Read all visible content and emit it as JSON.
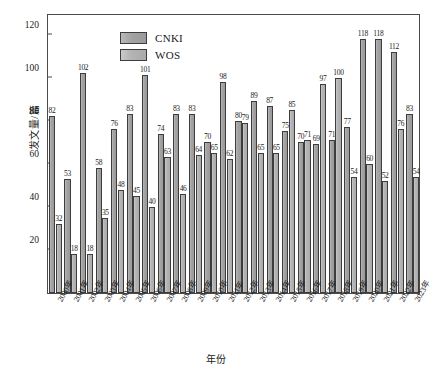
{
  "chart_data": {
    "type": "bar",
    "title": "",
    "xlabel": "年份",
    "ylabel": "发文量/篇",
    "ylim": [
      0,
      130
    ],
    "yticks": [
      20,
      40,
      60,
      80,
      100,
      120
    ],
    "grid": false,
    "legend_position": "top-left",
    "categories": [
      "2000年",
      "2001年",
      "2002年",
      "2003年",
      "2004年",
      "2005年",
      "2006年",
      "2007年",
      "2008年",
      "2009年",
      "2010年",
      "2011年",
      "2012年",
      "2013年",
      "2014年",
      "2015年",
      "2016年",
      "2017年",
      "2018年",
      "2019年",
      "2020年",
      "2021年",
      "2022年",
      "2023年"
    ],
    "series": [
      {
        "name": "CNKI",
        "color": "#a3a3a3",
        "values": [
          82,
          53,
          102,
          58,
          76,
          83,
          101,
          74,
          83,
          83,
          98,
          89,
          87,
          85,
          97,
          100,
          118,
          118,
          112,
          83,
          0,
          0,
          0,
          0
        ]
      },
      {
        "name": "WOS",
        "color": "#b4b4b4",
        "values": [
          32,
          18,
          18,
          35,
          48,
          45,
          40,
          63,
          46,
          64,
          70,
          65,
          62,
          80,
          79,
          65,
          65,
          75,
          70,
          71,
          69,
          71,
          77,
          54
        ]
      }
    ],
    "bars": [
      {
        "category": "2000年",
        "cnki": 82,
        "wos": 32
      },
      {
        "category": "2001年",
        "cnki": 53,
        "wos": 18
      },
      {
        "category": "2002年",
        "cnki": 102,
        "wos": 18
      },
      {
        "category": "2003年",
        "cnki": 58,
        "wos": 35
      },
      {
        "category": "2004年",
        "cnki": 76,
        "wos": 48
      },
      {
        "category": "2005年",
        "cnki": 83,
        "wos": 45
      },
      {
        "category": "2006年",
        "cnki": 101,
        "wos": 40
      },
      {
        "category": "2007年",
        "cnki": 74,
        "wos": 63
      },
      {
        "category": "2008年",
        "cnki": 83,
        "wos": 46
      },
      {
        "category": "2009年",
        "cnki": 83,
        "wos": 64
      },
      {
        "category": "2010年",
        "cnki": 70,
        "wos": 65
      },
      {
        "category": "2011年",
        "cnki": 98,
        "wos": 62
      },
      {
        "category": "2012年",
        "cnki": 80,
        "wos": 79
      },
      {
        "category": "2013年",
        "cnki": 89,
        "wos": 65
      },
      {
        "category": "2014年",
        "cnki": 87,
        "wos": 65
      },
      {
        "category": "2015年",
        "cnki": 75,
        "wos": 85
      },
      {
        "category": "2016年",
        "cnki": 70,
        "wos": 71
      },
      {
        "category": "2017年",
        "cnki": 69,
        "wos": 97
      },
      {
        "category": "2018年",
        "cnki": 71,
        "wos": 100
      },
      {
        "category": "2019年",
        "cnki": 77,
        "wos": 54
      },
      {
        "category": "2020年",
        "cnki": 118,
        "wos": 60
      },
      {
        "category": "2021年",
        "cnki": 118,
        "wos": 52
      },
      {
        "category": "2022年",
        "cnki": 112,
        "wos": 76
      },
      {
        "category": "2023年",
        "cnki": 83,
        "wos": 54
      }
    ],
    "labeled_values": [
      82,
      32,
      53,
      18,
      102,
      18,
      58,
      35,
      76,
      48,
      83,
      45,
      101,
      40,
      74,
      63,
      83,
      46,
      83,
      64,
      70,
      65,
      98,
      62,
      80,
      79,
      89,
      65,
      87,
      65,
      75,
      85,
      70,
      71,
      69,
      97,
      71,
      100,
      77,
      118,
      54,
      118,
      52,
      112,
      76,
      83,
      54
    ]
  },
  "legend": {
    "items": [
      {
        "label": "CNKI",
        "key": "cnki"
      },
      {
        "label": "WOS",
        "key": "wos"
      }
    ]
  }
}
